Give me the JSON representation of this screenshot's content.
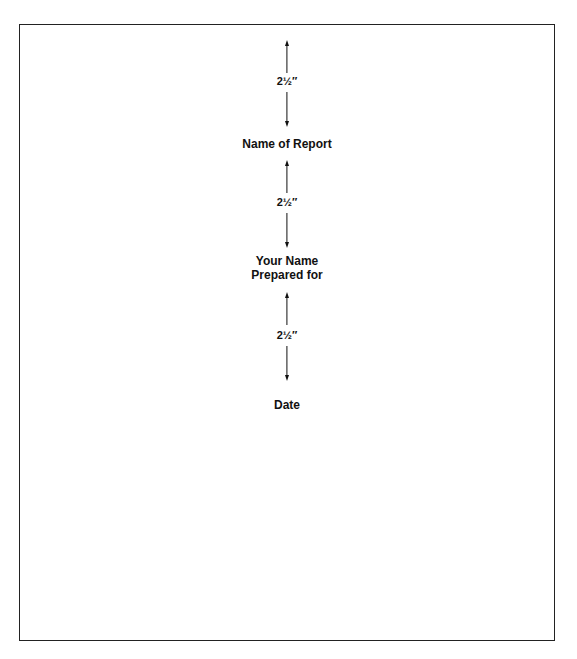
{
  "document": {
    "title_label": "Name of Report",
    "author_label": "Your Name",
    "prepared_label": "Prepared for",
    "date_label": "Date",
    "spacings": [
      {
        "measure": "2½″"
      },
      {
        "measure": "2½″"
      },
      {
        "measure": "2½″"
      }
    ]
  }
}
